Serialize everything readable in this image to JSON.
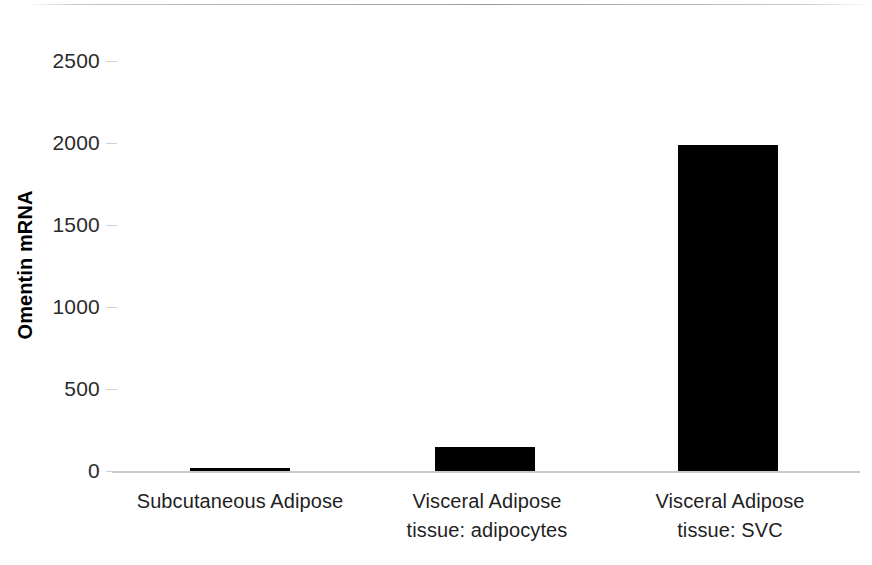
{
  "chart_data": {
    "type": "bar",
    "title": "",
    "subtitle": "",
    "xlabel": "",
    "ylabel": "Omentin mRNA",
    "categories": [
      "Subcutaneous Adipose",
      "Visceral Adipose\ntissue: adipocytes",
      "Visceral Adipose\ntissue: SVC"
    ],
    "values": [
      15,
      145,
      1985
    ],
    "ylim": [
      0,
      2600
    ],
    "yticks": [
      0,
      500,
      1000,
      1500,
      2000,
      2500
    ],
    "ytick_labels": [
      "0",
      "500",
      "1000",
      "1500",
      "2000",
      "2500"
    ],
    "grid": false,
    "legend": "none",
    "bar_color": "#000000",
    "axis_color": "#c9c9c9",
    "series": [
      {
        "name": "Omentin mRNA",
        "values": [
          15,
          145,
          1985
        ]
      }
    ]
  }
}
